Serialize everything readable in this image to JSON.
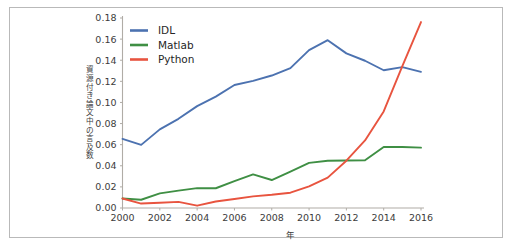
{
  "chart_data": {
    "type": "line",
    "title": "",
    "xlabel": "年",
    "ylabel": "資源付き論文中の言及数",
    "x": [
      2000,
      2001,
      2002,
      2003,
      2004,
      2005,
      2006,
      2007,
      2008,
      2009,
      2010,
      2011,
      2012,
      2013,
      2014,
      2015,
      2016
    ],
    "xlim": [
      2000,
      2016
    ],
    "ylim": [
      0.0,
      0.18
    ],
    "xticks": [
      2000,
      2002,
      2004,
      2006,
      2008,
      2010,
      2012,
      2014,
      2016
    ],
    "xtick_labels": [
      "2000",
      "2002",
      "2004",
      "2006",
      "2008",
      "2010",
      "2012",
      "2014",
      "2016"
    ],
    "yticks": [
      0.0,
      0.02,
      0.04,
      0.06,
      0.08,
      0.1,
      0.12,
      0.14,
      0.16,
      0.18
    ],
    "ytick_labels": [
      "0.00",
      "0.02",
      "0.04",
      "0.06",
      "0.08",
      "0.10",
      "0.12",
      "0.14",
      "0.16",
      "0.18"
    ],
    "grid": false,
    "legend_position": "upper left",
    "series": [
      {
        "name": "IDL",
        "color": "#4c72b0",
        "values": [
          0.0655,
          0.0598,
          0.0745,
          0.0845,
          0.0965,
          0.1055,
          0.1165,
          0.1205,
          0.1255,
          0.1325,
          0.1495,
          0.159,
          0.1465,
          0.1395,
          0.1305,
          0.1335,
          0.129
        ]
      },
      {
        "name": "Matlab",
        "color": "#3f8f44",
        "values": [
          0.009,
          0.0078,
          0.0138,
          0.0165,
          0.0188,
          0.0187,
          0.0255,
          0.0318,
          0.0265,
          0.0345,
          0.0428,
          0.0448,
          0.045,
          0.0452,
          0.0578,
          0.0578,
          0.0572
        ]
      },
      {
        "name": "Python",
        "color": "#e8543f",
        "values": [
          0.009,
          0.0042,
          0.005,
          0.0058,
          0.0022,
          0.0062,
          0.0085,
          0.011,
          0.0125,
          0.0145,
          0.0205,
          0.0288,
          0.0448,
          0.064,
          0.0915,
          0.1345,
          0.1762
        ]
      }
    ]
  },
  "legend": {
    "items": [
      {
        "label": "IDL",
        "color": "#4c72b0"
      },
      {
        "label": "Matlab",
        "color": "#3f8f44"
      },
      {
        "label": "Python",
        "color": "#e8543f"
      }
    ]
  },
  "axes": {
    "y_axis_title": "資源付き論文中の言及数",
    "x_axis_title": "年"
  },
  "colors": {
    "idl": "#4c72b0",
    "matlab": "#3f8f44",
    "python": "#e8543f",
    "spine": "#b0aca6",
    "frame": "#b9b9b9",
    "text": "#3c3c3c"
  }
}
